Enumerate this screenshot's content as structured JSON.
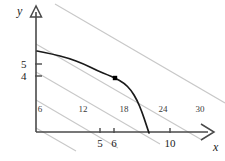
{
  "figure": {
    "kind": "economics-isoquant-diagram",
    "background_color": "#ffffff",
    "axis_color": "#4a4a4a",
    "curve_color": "#1a1a1a",
    "isoline_color": "#c8c8c8",
    "point_color": "#000000"
  },
  "axes": {
    "x_label": "x",
    "y_label": "y",
    "x_ticks": [
      {
        "value": 5,
        "label": "5",
        "px": 100
      },
      {
        "value": 6,
        "label": "6",
        "px": 114
      },
      {
        "value": 10,
        "label": "10",
        "px": 170
      }
    ],
    "y_ticks": [
      {
        "value": 5,
        "label": "5",
        "px": 64
      },
      {
        "value": 4,
        "label": "4",
        "px": 76
      }
    ],
    "origin_px": {
      "x": 36,
      "y": 132
    },
    "x_axis_end_px": 214,
    "y_axis_end_px": 8
  },
  "chart_data": {
    "type": "line",
    "title": "",
    "xlabel": "x",
    "ylabel": "y",
    "xlim": [
      0,
      13
    ],
    "ylim": [
      0,
      9
    ],
    "grid": false,
    "legend": null,
    "series": [
      {
        "name": "constraint-curve",
        "kind": "curve",
        "color": "#1a1a1a",
        "points_px": [
          [
            37,
            51
          ],
          [
            52,
            54
          ],
          [
            68,
            58
          ],
          [
            84,
            64
          ],
          [
            98,
            71
          ],
          [
            108,
            75
          ],
          [
            115,
            78
          ],
          [
            124,
            83
          ],
          [
            131,
            90
          ],
          [
            137,
            100
          ],
          [
            142,
            112
          ],
          [
            146,
            124
          ],
          [
            149,
            133
          ]
        ]
      }
    ],
    "isolines": {
      "name": "budget-lines",
      "labels": [
        "6",
        "12",
        "18",
        "24",
        "30"
      ],
      "values": [
        6,
        12,
        18,
        24,
        30
      ],
      "color": "#c8c8c8",
      "slope_px": -0.58,
      "label_px": [
        {
          "text": "6",
          "x": 40,
          "y": 105
        },
        {
          "text": "12",
          "x": 83,
          "y": 105
        },
        {
          "text": "18",
          "x": 124,
          "y": 105
        },
        {
          "text": "24",
          "x": 163,
          "y": 105
        },
        {
          "text": "30",
          "x": 200,
          "y": 105
        }
      ],
      "segments_px": [
        [
          [
            36,
            128
          ],
          [
            76,
            151
          ]
        ],
        [
          [
            36,
            100
          ],
          [
            118,
            148
          ]
        ],
        [
          [
            36,
            72
          ],
          [
            160,
            144
          ]
        ],
        [
          [
            36,
            44
          ],
          [
            202,
            140
          ]
        ],
        [
          [
            55,
            4
          ],
          [
            225,
            103
          ]
        ]
      ]
    },
    "annotated_points": [
      {
        "name": "tangency-point",
        "x": 6,
        "y": 4,
        "px": [
          115,
          78
        ],
        "label": ""
      }
    ]
  }
}
